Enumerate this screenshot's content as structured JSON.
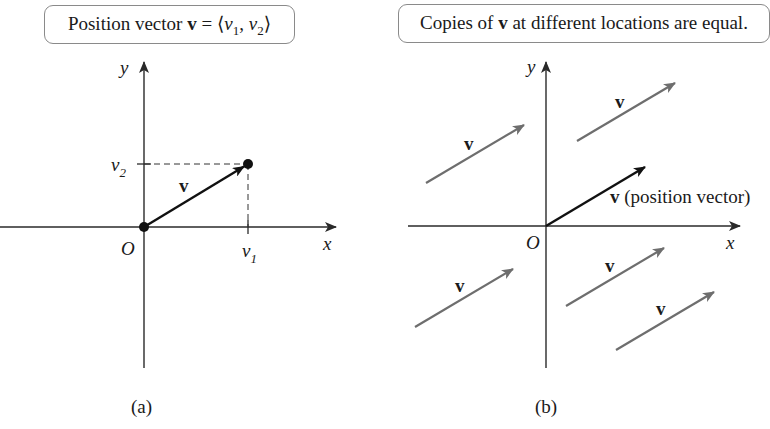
{
  "panel_a": {
    "title_prefix": "Position vector ",
    "title_bold": "v",
    "title_eq": " = ⟨",
    "title_v1": "v",
    "title_v1_sub": "1",
    "title_comma": ", ",
    "title_v2": "v",
    "title_v2_sub": "2",
    "title_close": "⟩",
    "axis_y_label": "y",
    "axis_x_label": "x",
    "origin_label": "O",
    "vector_label": "v",
    "tick_x_label": "v",
    "tick_x_sub": "1",
    "tick_y_label": "v",
    "tick_y_sub": "2",
    "caption": "(a)"
  },
  "panel_b": {
    "title_prefix": "Copies of ",
    "title_bold": "v",
    "title_suffix": " at different locations are equal.",
    "axis_y_label": "y",
    "axis_x_label": "x",
    "origin_label": "O",
    "position_vector_label_bold": "v",
    "position_vector_label_rest": " (position vector)",
    "copy_label": "v",
    "caption": "(b)"
  },
  "colors": {
    "axis": "#2a2a2a",
    "position_vector": "#111111",
    "copy_vector": "#6e6e6e",
    "box_border": "#8a8a8a"
  }
}
